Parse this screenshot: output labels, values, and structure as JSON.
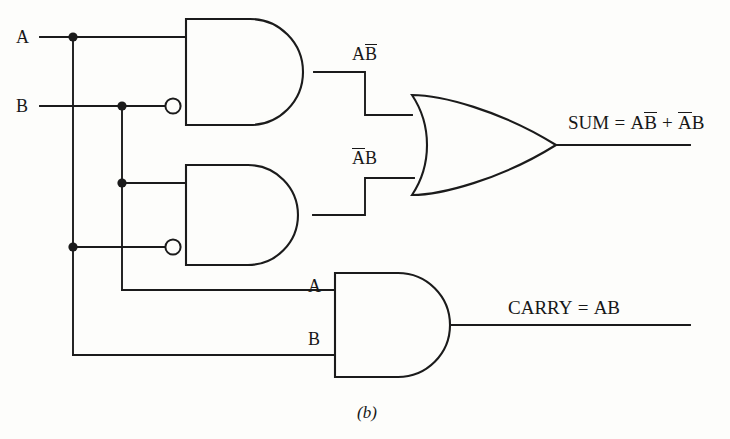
{
  "figure": {
    "caption": "(b)",
    "type": "logic-gate-diagram"
  },
  "inputs": [
    {
      "id": "A",
      "label": "A",
      "x": 22,
      "y": 37
    },
    {
      "id": "B",
      "label": "B",
      "x": 22,
      "y": 106
    }
  ],
  "gate_input_labels": [
    {
      "id": "carry-a",
      "label": "A",
      "x": 310,
      "y": 287
    },
    {
      "id": "carry-b",
      "label": "B",
      "x": 310,
      "y": 340
    }
  ],
  "intermediate_labels": [
    {
      "id": "ab-bar",
      "lead": "A",
      "bar": "B",
      "x": 352,
      "y": 46
    },
    {
      "id": "a-bar-b",
      "lead": "",
      "bar": "A",
      "tail": "B",
      "x": 352,
      "y": 150
    }
  ],
  "outputs": {
    "sum": {
      "name": "SUM",
      "equals": "=",
      "term1_plain": "A",
      "term1_bar": "B",
      "plus": "+",
      "term2_bar": "A",
      "term2_plain": "B",
      "full_text": "SUM = AB̅ + A̅B",
      "x": 568,
      "y": 114
    },
    "carry": {
      "name": "CARRY",
      "equals": "=",
      "term": "AB",
      "full_text": "CARRY = AB",
      "x": 508,
      "y": 300
    }
  },
  "gates": [
    {
      "id": "and-top",
      "type": "AND",
      "output": "AB̅",
      "inverted_inputs": [
        "B"
      ],
      "x": 185,
      "y": 19,
      "w": 130,
      "h": 106
    },
    {
      "id": "and-middle",
      "type": "AND",
      "output": "A̅B",
      "inverted_inputs": [
        "A"
      ],
      "x": 185,
      "y": 165,
      "w": 130,
      "h": 100
    },
    {
      "id": "or-sum",
      "type": "OR",
      "output": "SUM",
      "inverted_inputs": [],
      "x": 412,
      "y": 95,
      "w": 143,
      "h": 100
    },
    {
      "id": "and-carry",
      "type": "AND",
      "output": "CARRY",
      "inverted_inputs": [],
      "x": 334,
      "y": 273,
      "w": 126,
      "h": 104
    }
  ],
  "colors": {
    "ink": "#1b1b1b",
    "paper": "#fdfdfb",
    "text": "#171717"
  }
}
